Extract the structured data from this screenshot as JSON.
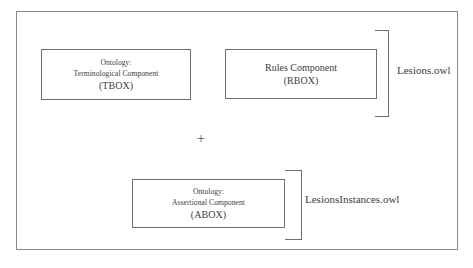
{
  "diagram": {
    "colors": {
      "background": "#ffffff",
      "frame_border": "#8a8a8a",
      "box_border": "#6e6e6e",
      "text": "#3d3d3d"
    },
    "boxes": [
      {
        "id": "tbox",
        "lines": [
          "Ontology:",
          "Terminological Component",
          "(TBOX)"
        ]
      },
      {
        "id": "rbox",
        "lines": [
          "Rules Component",
          "(RBOX)"
        ]
      },
      {
        "id": "abox",
        "lines": [
          "Ontology:",
          "Assertional Component",
          "(ABOX)"
        ]
      }
    ],
    "operator": "+",
    "labels": {
      "upper_file": "Lesions.owl",
      "lower_file": "LesionsInstances.owl"
    }
  }
}
